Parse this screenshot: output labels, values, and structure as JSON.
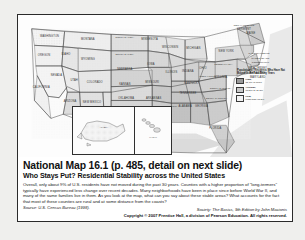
{
  "slide": {
    "title": "National Map 16.1  (p. 485, detail on next slide)",
    "subtitle": "Who Stays Put? Residential Stability across the United States",
    "body": "Overall, only about 9% of U.S. residents have not moved during the past 30 years. Counties with a higher proportion of \"long-termers\" typically have experienced less change over recent decades. Many neighborhoods have been in place since before World War II, and many of the same families live in them. As you look at the map, what can you say about these stable areas? What accounts for the fact that most of these counties are rural and at some distance from the coasts?",
    "source": "Source: U.S. Census Bureau (1998).",
    "credit": "Society: The Basics, 9th Edition by John Macionis",
    "copyright": "Copyright © 2007 Prentice Hall, a division of Pearson Education. All rights reserved."
  },
  "legend": {
    "title": "Population of Residents Who Have Not Moved in the Past Thirty Years",
    "items": [
      {
        "label": "High,",
        "range": "11.6% or more",
        "swatch": "#9a9a9a",
        "swatch_name": "high-swatch"
      },
      {
        "label": "Average,",
        "range": "13.2% to 11.5%",
        "swatch": "#c9c9c9",
        "swatch_name": "average-swatch"
      },
      {
        "label": "Low,",
        "range": "Less than 13.2%",
        "swatch": "#f2f2f2",
        "swatch_name": "low-swatch"
      }
    ]
  },
  "insets": {
    "alaska": "ALASKA",
    "hawaii": "HAWAII"
  },
  "map": {
    "alt": "Choropleth map of the continental United States shaded by county residential stability",
    "states": [
      {
        "n": "WASHINGTON",
        "x": 23,
        "y": 16
      },
      {
        "n": "OREGON",
        "x": 19,
        "y": 30
      },
      {
        "n": "IDAHO",
        "x": 35,
        "y": 29
      },
      {
        "n": "MONTANA",
        "x": 51,
        "y": 18
      },
      {
        "n": "NORTH DAKOTA",
        "x": 78,
        "y": 17
      },
      {
        "n": "SOUTH DAKOTA",
        "x": 78,
        "y": 29
      },
      {
        "n": "MINNESOTA",
        "x": 96,
        "y": 18
      },
      {
        "n": "WISCONSIN",
        "x": 111,
        "y": 24
      },
      {
        "n": "MICHIGAN",
        "x": 128,
        "y": 25
      },
      {
        "n": "WYOMING",
        "x": 51,
        "y": 33
      },
      {
        "n": "NEBRASKA",
        "x": 78,
        "y": 40
      },
      {
        "n": "IOWA",
        "x": 97,
        "y": 36
      },
      {
        "n": "ILLINOIS",
        "x": 112,
        "y": 42
      },
      {
        "n": "INDIANA",
        "x": 124,
        "y": 41
      },
      {
        "n": "OHIO",
        "x": 135,
        "y": 39
      },
      {
        "n": "NEVADA",
        "x": 28,
        "y": 44
      },
      {
        "n": "UTAH",
        "x": 41,
        "y": 48
      },
      {
        "n": "COLORADO",
        "x": 56,
        "y": 49
      },
      {
        "n": "KANSAS",
        "x": 78,
        "y": 51
      },
      {
        "n": "MISSOURI",
        "x": 98,
        "y": 49
      },
      {
        "n": "KENTUCKY",
        "x": 127,
        "y": 50
      },
      {
        "n": "CALIFORNIA",
        "x": 17,
        "y": 53
      },
      {
        "n": "ARIZONA",
        "x": 38,
        "y": 63
      },
      {
        "n": "NEW MEXICO",
        "x": 54,
        "y": 64
      },
      {
        "n": "OKLAHOMA",
        "x": 79,
        "y": 61
      },
      {
        "n": "ARKANSAS",
        "x": 99,
        "y": 61
      },
      {
        "n": "TENNESSEE",
        "x": 124,
        "y": 57
      },
      {
        "n": "TEXAS",
        "x": 73,
        "y": 78
      },
      {
        "n": "LOUISIANA",
        "x": 100,
        "y": 72
      },
      {
        "n": "MISSISSIPPI",
        "x": 111,
        "y": 67
      },
      {
        "n": "ALABAMA",
        "x": 122,
        "y": 67
      },
      {
        "n": "GEORGIA",
        "x": 134,
        "y": 67
      },
      {
        "n": "FLORIDA",
        "x": 144,
        "y": 83
      },
      {
        "n": "SOUTH CAROLINA",
        "x": 145,
        "y": 61
      },
      {
        "n": "NORTH CAROLINA",
        "x": 148,
        "y": 54
      },
      {
        "n": "VIRGINIA",
        "x": 148,
        "y": 46
      },
      {
        "n": "WEST VIRGINIA",
        "x": 139,
        "y": 45
      },
      {
        "n": "PENNSYLVANIA",
        "x": 150,
        "y": 36
      },
      {
        "n": "NEW YORK",
        "x": 152,
        "y": 27
      },
      {
        "n": "MAINE",
        "x": 170,
        "y": 14
      },
      {
        "n": "NEW HAMPSHIRE",
        "x": 165,
        "y": 8
      },
      {
        "n": "VERMONT",
        "x": 165,
        "y": 11
      },
      {
        "n": "MASSACHUSETTS",
        "x": 176,
        "y": 28
      },
      {
        "n": "RHODE ISLAND",
        "x": 177,
        "y": 32
      },
      {
        "n": "CONNECTICUT",
        "x": 177,
        "y": 35
      },
      {
        "n": "NEW JERSEY",
        "x": 175,
        "y": 39
      },
      {
        "n": "DELAWARE",
        "x": 175,
        "y": 43
      },
      {
        "n": "MARYLAND",
        "x": 175,
        "y": 46
      }
    ]
  }
}
